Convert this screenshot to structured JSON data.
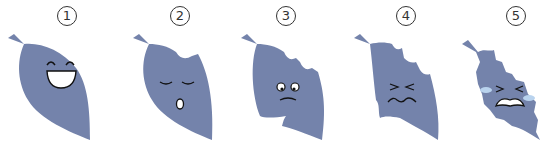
{
  "colors": {
    "leaf": "#7483ab",
    "face_line": "#1a1a2e",
    "tear": "#b9d3ee",
    "background": "#ffffff"
  },
  "stages": [
    {
      "number": "1",
      "expression": "happy-laughing"
    },
    {
      "number": "2",
      "expression": "sleepy-surprised"
    },
    {
      "number": "3",
      "expression": "worried"
    },
    {
      "number": "4",
      "expression": "squinting-upset"
    },
    {
      "number": "5",
      "expression": "crying"
    }
  ]
}
